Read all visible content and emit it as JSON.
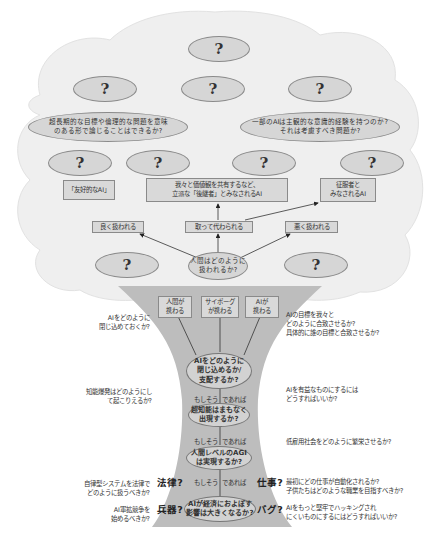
{
  "diagram": {
    "type": "tree",
    "canopy": {
      "top_question": "?",
      "row2_questions": [
        "?",
        "?",
        "?"
      ],
      "big_questions": [
        "超長期的な目標や倫理的な問題を意味のある形で論じることはできるか?",
        "一部のAIは主観的な意識的経験を持つのか?それは考慮すべき問題か?"
      ],
      "row4_questions": [
        "?",
        "?",
        "?",
        "?"
      ],
      "outcomes": [
        "「友好的なAI」",
        "我々と価値観を共有するなど、立派な「後継者」とみなされるAI",
        "征服者とみなされるAI"
      ],
      "treatments": [
        "良く扱われる",
        "取って代わられる",
        "悪く扱われる"
      ],
      "side_questions": [
        "?",
        "?"
      ],
      "center_question": "人間はどのように扱われるか?"
    },
    "trunk": {
      "actors": [
        "人間が携わる",
        "サイボーグが携わる",
        "AIが携わる"
      ],
      "control_question": "AIをどのように閉じ込めるか/支配するか?",
      "superintelligence_question": "超知能はまもなく出現するか?",
      "agi_question": "人間レベルのAGIは実現するか?",
      "economy_question": "AIが経済におよぼす影響は大きくなるか?",
      "condition_left": "もしそう",
      "condition_right": "であれば",
      "keywords": {
        "law": "法律?",
        "jobs": "仕事?",
        "weapons": "兵器?",
        "bugs": "バグ?"
      }
    },
    "left_questions": [
      "AIをどのように閉じ込めておくか?",
      "知能爆発はどのようにして起こりえるか?",
      "自律型システムを法律でどのように扱うべきか?",
      "AI軍拡競争を始めるべきか?"
    ],
    "right_questions": [
      "AIの目標を我々とどのように合致させるか?具体的に誰の目標と合致させるか?",
      "AIを有益なものにするにはどうすればいいか?",
      "低雇用社会をどのように繁栄させるか?",
      "最初にどの仕事が自動化されるか?子供たちはどのような職業を目指すべきか?",
      "AIをもっと堅牢でハッキングされにくいものにするにはどうすればいいか?"
    ]
  },
  "text_split": {
    "big_left": [
      "超長期的な目標や倫理的な問題を意味",
      "のある形で論じることはできるか?"
    ],
    "big_right": [
      "一部のAIは主観的な意識的経験を持つのか?",
      "それは考慮すべき問題か?"
    ],
    "outcome_mid": [
      "我々と価値観を共有するなど、",
      "立派な「後継者」とみなされるAI"
    ],
    "outcome_right": [
      "征服者と",
      "みなされるAI"
    ],
    "center": [
      "人間はどのように",
      "扱われるか?"
    ],
    "actor1": [
      "人間が",
      "携わる"
    ],
    "actor2": [
      "サイボーグ",
      "が携わる"
    ],
    "actor3": [
      "AIが",
      "携わる"
    ],
    "control": [
      "AIをどのように",
      "閉じ込めるか/",
      "支配するか?"
    ],
    "super": [
      "超知能はまもなく",
      "出現するか?"
    ],
    "agi": [
      "人間レベルのAGI",
      "は実現するか?"
    ],
    "econ": [
      "AIが経済におよぼす",
      "影響は大きくなるか?"
    ],
    "lq1": [
      "AIをどのように",
      "閉じ込めておくか?"
    ],
    "lq2": [
      "知能爆発はどのようにし",
      "て起こりえるか?"
    ],
    "lq3": [
      "自律型システムを法律で",
      "どのように扱うべきか?"
    ],
    "lq4": [
      "AI軍拡競争を",
      "始めるべきか?"
    ],
    "rq1": [
      "AIの目標を我々と",
      "どのように合致させるか?",
      "具体的に誰の目標と合致させるか?"
    ],
    "rq2": [
      "AIを有益なものにするには",
      "どうすればいいか?"
    ],
    "rq3": [
      "低雇用社会をどのように繁栄させるか?"
    ],
    "rq4": [
      "最初にどの仕事が自動化されるか?",
      "子供たちはどのような職業を目指すべきか?"
    ],
    "rq5": [
      "AIをもっと堅牢でハッキングされ",
      "にくいものにするにはどうすればいいか?"
    ]
  },
  "colors": {
    "canopy": "#efefef",
    "trunk": "#bdbdbd",
    "ellipse": "#d6d6d6",
    "box": "#d9d9d9",
    "outline": "#8a8a8a",
    "text": "#333333"
  }
}
